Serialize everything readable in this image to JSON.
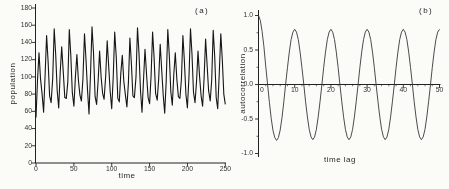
{
  "paper_color": "#fbfbf8",
  "ink_color": "#222222",
  "panel_a": {
    "tag": "(a)",
    "xlabel": "time",
    "ylabel": "population",
    "x_tick_labels": [
      "0",
      "50",
      "100",
      "150",
      "200",
      "250"
    ],
    "y_tick_labels": [
      "0",
      "20",
      "40",
      "60",
      "80",
      "100",
      "120",
      "140",
      "160",
      "180"
    ]
  },
  "panel_b": {
    "tag": "(b)",
    "xlabel": "time lag",
    "ylabel": "autocorrelation",
    "x_tick_labels": [
      "10",
      "20",
      "30",
      "40",
      "50"
    ],
    "x_origin_label": "0",
    "y_tick_labels": [
      "1.0",
      "0.5",
      "0.0",
      "-0.5",
      "-1.0"
    ],
    "y_minor_ticks": [
      0.75,
      0.25,
      -0.25,
      -0.75
    ],
    "x_minor_tick_step": 2
  },
  "chart_data": [
    {
      "panel": "a",
      "type": "line",
      "title": "",
      "xlabel": "time",
      "ylabel": "population",
      "xlim": [
        0,
        250
      ],
      "ylim": [
        0,
        185
      ],
      "grid": false,
      "x_start": 0,
      "x_step": 2,
      "values": [
        53,
        96,
        128,
        98,
        80,
        59,
        102,
        148,
        118,
        78,
        70,
        98,
        156,
        126,
        84,
        64,
        105,
        135,
        105,
        76,
        75,
        94,
        155,
        125,
        82,
        66,
        100,
        126,
        96,
        79,
        72,
        97,
        150,
        120,
        85,
        57,
        103,
        158,
        128,
        77,
        68,
        95,
        130,
        100,
        81,
        74,
        101,
        142,
        112,
        83,
        63,
        99,
        152,
        122,
        75,
        71,
        104,
        125,
        95,
        80,
        65,
        93,
        145,
        115,
        78,
        76,
        100,
        157,
        127,
        84,
        59,
        96,
        132,
        102,
        76,
        69,
        102,
        152,
        122,
        81,
        73,
        98,
        138,
        108,
        79,
        58,
        95,
        155,
        125,
        83,
        67,
        103,
        128,
        98,
        77,
        75,
        97,
        148,
        118,
        80,
        64,
        101,
        156,
        126,
        82,
        70,
        94,
        130,
        100,
        78,
        66,
        99,
        144,
        114,
        84,
        72,
        96,
        154,
        124,
        76,
        63,
        102,
        150,
        120,
        80,
        68
      ]
    },
    {
      "panel": "b",
      "type": "line",
      "title": "",
      "xlabel": "time lag",
      "ylabel": "autocorrelation",
      "xlim": [
        0,
        50
      ],
      "ylim": [
        -1.0,
        1.0
      ],
      "grid": false,
      "x_start": 0,
      "x_step": 0.5,
      "values": [
        1.0,
        0.93,
        0.77,
        0.55,
        0.27,
        0.0,
        -0.26,
        -0.49,
        -0.67,
        -0.77,
        -0.81,
        -0.77,
        -0.66,
        -0.48,
        -0.25,
        0.0,
        0.25,
        0.47,
        0.65,
        0.76,
        0.8,
        0.76,
        0.65,
        0.47,
        0.25,
        0.0,
        -0.25,
        -0.47,
        -0.65,
        -0.76,
        -0.8,
        -0.76,
        -0.65,
        -0.47,
        -0.25,
        0.0,
        0.25,
        0.47,
        0.65,
        0.76,
        0.8,
        0.76,
        0.65,
        0.47,
        0.25,
        0.0,
        -0.25,
        -0.47,
        -0.65,
        -0.76,
        -0.8,
        -0.76,
        -0.65,
        -0.47,
        -0.25,
        0.0,
        0.25,
        0.47,
        0.65,
        0.76,
        0.8,
        0.76,
        0.65,
        0.47,
        0.25,
        0.0,
        -0.25,
        -0.47,
        -0.65,
        -0.76,
        -0.8,
        -0.76,
        -0.65,
        -0.47,
        -0.25,
        0.0,
        0.25,
        0.47,
        0.65,
        0.76,
        0.8,
        0.76,
        0.65,
        0.47,
        0.25,
        0.0,
        -0.25,
        -0.47,
        -0.65,
        -0.76,
        -0.8,
        -0.76,
        -0.65,
        -0.47,
        -0.25,
        0.0,
        0.25,
        0.47,
        0.65,
        0.76,
        0.8
      ]
    }
  ]
}
